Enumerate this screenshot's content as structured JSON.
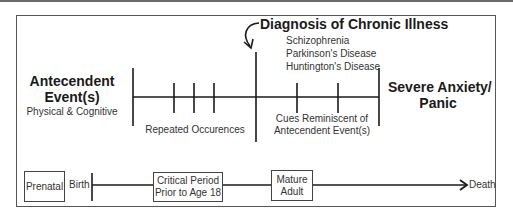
{
  "diagram": {
    "left_event": {
      "title_line1": "Antecendent",
      "title_line2": "Event(s)",
      "subtitle": "Physical & Cognitive"
    },
    "diagnosis": {
      "title": "Diagnosis of Chronic Illness",
      "examples": [
        "Schizophrenia",
        "Parkinson's Disease",
        "Huntington's Disease"
      ]
    },
    "right_event": {
      "title_line1": "Severe Anxiety/",
      "title_line2": "Panic"
    },
    "segments": {
      "repeated": "Repeated Occurences",
      "cues_line1": "Cues Reminiscent of",
      "cues_line2": "Antecendent Event(s)"
    },
    "lifespan": {
      "prenatal": "Prenatal",
      "birth": "Birth",
      "critical_line1": "Critical Period",
      "critical_line2": "Prior to Age 18",
      "mature_line1": "Mature",
      "mature_line2": "Adult",
      "death": "Death"
    },
    "colors": {
      "line": "#1a1a1a",
      "frame": "#555555",
      "text": "#1a1a1a",
      "subtext": "#333333"
    }
  }
}
